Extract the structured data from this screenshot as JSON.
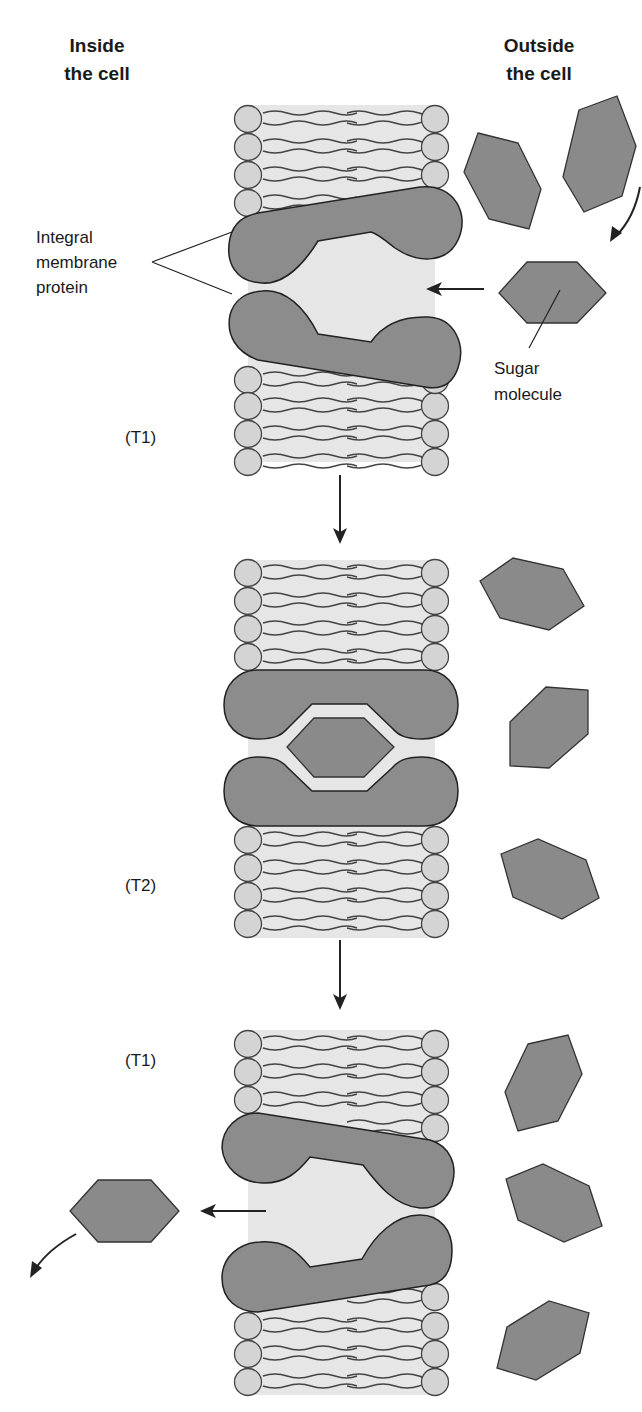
{
  "headers": {
    "inside": [
      "Inside",
      "the cell"
    ],
    "outside": [
      "Outside",
      "the cell"
    ]
  },
  "labels": {
    "protein": [
      "Integral",
      "membrane",
      "protein"
    ],
    "sugar": [
      "Sugar",
      "molecule"
    ]
  },
  "stages": [
    {
      "id": "stage-1",
      "label": "(T1)",
      "description": "Transporter open to outside; sugar approaches binding site"
    },
    {
      "id": "stage-2",
      "label": "(T2)",
      "description": "Sugar bound inside transporter; both gates closed"
    },
    {
      "id": "stage-3",
      "label": "(T1)",
      "description": "Transporter open to inside; sugar released into cell"
    }
  ],
  "colors": {
    "protein": "#8c8c8c",
    "sugar": "#8a8a8a",
    "phospholipid_head": "#d4d4d4",
    "membrane_core": "#e6e6e6",
    "outline": "#222222"
  }
}
